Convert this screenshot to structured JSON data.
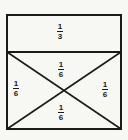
{
  "diagram": {
    "colors": {
      "background": "#f7f7f3",
      "stroke": "#1a1a1a"
    },
    "regions": [
      {
        "id": "top",
        "numerator": "1",
        "denominator": "3",
        "label": "1/3"
      },
      {
        "id": "upper-triangle",
        "numerator": "1",
        "denominator": "6",
        "label": "1/6"
      },
      {
        "id": "left-triangle",
        "numerator": "1",
        "denominator": "6",
        "label": "1/6"
      },
      {
        "id": "right-triangle",
        "numerator": "1",
        "denominator": "6",
        "label": "1/6"
      },
      {
        "id": "lower-triangle",
        "numerator": "1",
        "denominator": "6",
        "label": "1/6"
      }
    ]
  }
}
